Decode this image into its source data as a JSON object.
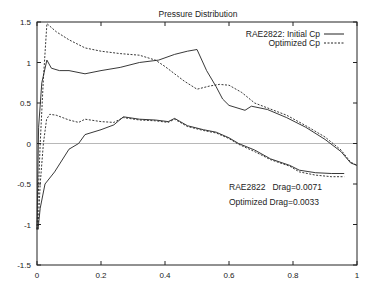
{
  "chart_data": {
    "type": "line",
    "title": "Pressure Distribution",
    "xlabel": "",
    "ylabel": "",
    "xlim": [
      0,
      1
    ],
    "ylim": [
      -1.5,
      1.5
    ],
    "x_ticks": [
      0,
      0.2,
      0.4,
      0.6,
      0.8,
      1
    ],
    "x_tick_labels": [
      "0",
      "0.2",
      "0.4",
      "0.6",
      "0.8",
      "1"
    ],
    "y_ticks": [
      -1.5,
      -1,
      -0.5,
      0,
      0.5,
      1,
      1.5
    ],
    "y_tick_labels": [
      "-1.5",
      "-1",
      "-0.5",
      "0",
      "0.5",
      "1",
      "1.5"
    ],
    "grid": false,
    "zero_line": true,
    "legend_position": "upper right",
    "legend": [
      {
        "label": "RAE2822: Initial Cp",
        "style": "solid"
      },
      {
        "label": "Optimized Cp",
        "style": "dashed"
      }
    ],
    "annotations": [
      {
        "text": "RAE2822   Drag=0.0071",
        "x": 0.58,
        "y": -0.55
      },
      {
        "text": "Optimized Drag=0.0033",
        "x": 0.58,
        "y": -0.74
      }
    ],
    "series": [
      {
        "name": "RAE2822: Initial Cp (upper surface)",
        "style": "solid",
        "x": [
          0.0,
          0.005,
          0.015,
          0.031,
          0.045,
          0.07,
          0.1,
          0.15,
          0.2,
          0.26,
          0.32,
          0.38,
          0.43,
          0.47,
          0.5,
          0.53,
          0.56,
          0.58,
          0.6,
          0.65,
          0.67,
          0.72,
          0.78,
          0.84,
          0.9,
          0.95,
          0.98,
          1.0
        ],
        "y": [
          -1.06,
          0.2,
          0.75,
          1.03,
          0.93,
          0.9,
          0.9,
          0.86,
          0.9,
          0.94,
          1.0,
          1.03,
          1.1,
          1.14,
          1.16,
          0.9,
          0.7,
          0.55,
          0.47,
          0.41,
          0.46,
          0.42,
          0.32,
          0.2,
          0.05,
          -0.1,
          -0.24,
          -0.27
        ]
      },
      {
        "name": "Optimized Cp (upper surface)",
        "style": "dashed",
        "x": [
          0.0,
          0.01,
          0.02,
          0.031,
          0.06,
          0.1,
          0.15,
          0.2,
          0.26,
          0.32,
          0.37,
          0.4,
          0.43,
          0.46,
          0.5,
          0.54,
          0.57,
          0.6,
          0.64,
          0.68,
          0.72,
          0.78,
          0.84,
          0.9,
          0.95,
          0.98,
          1.0
        ],
        "y": [
          -1.06,
          0.0,
          0.8,
          1.48,
          1.38,
          1.28,
          1.18,
          1.14,
          1.11,
          1.09,
          1.03,
          0.95,
          0.86,
          0.77,
          0.67,
          0.71,
          0.73,
          0.72,
          0.63,
          0.5,
          0.44,
          0.35,
          0.22,
          0.08,
          -0.08,
          -0.23,
          -0.27
        ]
      },
      {
        "name": "RAE2822: Initial Cp (lower surface)",
        "style": "solid",
        "x": [
          0.003,
          0.01,
          0.025,
          0.055,
          0.1,
          0.13,
          0.15,
          0.2,
          0.24,
          0.27,
          0.32,
          0.37,
          0.41,
          0.43,
          0.47,
          0.52,
          0.56,
          0.6,
          0.63,
          0.68,
          0.73,
          0.79,
          0.82,
          0.87,
          0.92,
          0.96
        ],
        "y": [
          -1.06,
          -0.8,
          -0.5,
          -0.35,
          -0.07,
          0.0,
          0.11,
          0.17,
          0.23,
          0.33,
          0.3,
          0.29,
          0.27,
          0.31,
          0.22,
          0.17,
          0.14,
          0.07,
          0.0,
          -0.08,
          -0.19,
          -0.27,
          -0.33,
          -0.36,
          -0.37,
          -0.37
        ]
      },
      {
        "name": "Optimized Cp (lower surface)",
        "style": "dashed",
        "x": [
          0.003,
          0.01,
          0.02,
          0.03,
          0.04,
          0.06,
          0.1,
          0.13,
          0.15,
          0.2,
          0.24,
          0.27,
          0.32,
          0.37,
          0.41,
          0.43,
          0.47,
          0.52,
          0.56,
          0.6,
          0.63,
          0.68,
          0.73,
          0.79,
          0.82,
          0.87,
          0.92,
          0.96
        ],
        "y": [
          -1.06,
          -0.5,
          0.0,
          0.3,
          0.36,
          0.35,
          0.29,
          0.26,
          0.3,
          0.27,
          0.26,
          0.32,
          0.29,
          0.28,
          0.26,
          0.3,
          0.21,
          0.16,
          0.13,
          0.06,
          -0.01,
          -0.1,
          -0.2,
          -0.28,
          -0.35,
          -0.39,
          -0.41,
          -0.41
        ]
      }
    ]
  }
}
